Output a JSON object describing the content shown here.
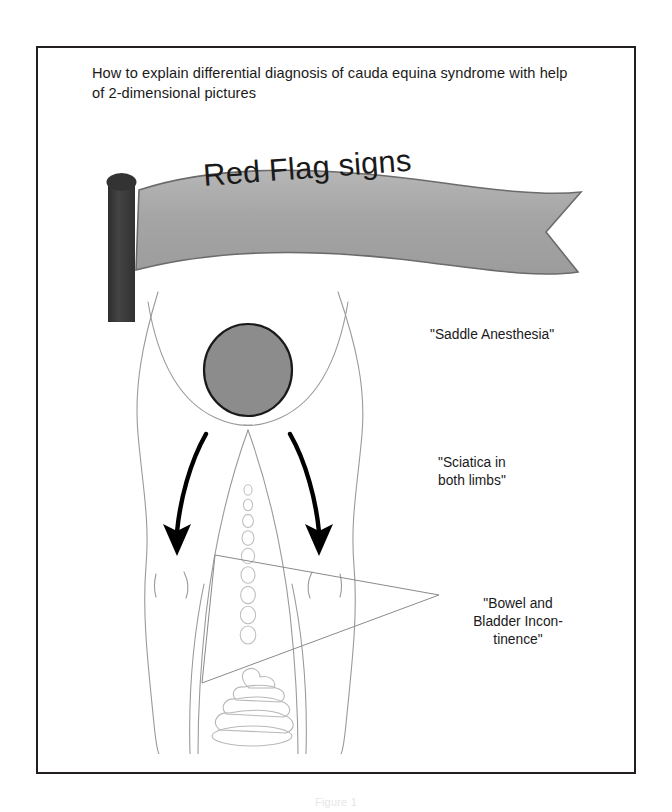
{
  "figure": {
    "title": "How to explain differential diagnosis of cauda equina syndrome with help of 2-dimensional pictures",
    "bottom_caption": "Figure 1"
  },
  "banner": {
    "label": "Red Flag signs",
    "flag_fill": "#a9a9a9",
    "flag_stroke": "#595959",
    "pole_fill": "#3b3b3b"
  },
  "illustration": {
    "outline_color": "#9a9a9a",
    "saddle_circle_fill": "#8c8c8c",
    "saddle_circle_stroke": "#1a1a1a",
    "arrow_color": "#000000",
    "pointer_color": "#8a8a8a",
    "parts": {
      "saddle_region": "saddle-area-circle",
      "left_arrow": "sciatica-arrow-left",
      "right_arrow": "sciatica-arrow-right",
      "urine_drops": "urine-drop-chain",
      "stool": "stool-shape",
      "pointer_triangle": "incontinence-pointer-triangle"
    }
  },
  "callouts": {
    "saddle": "\"Saddle Anesthesia\"",
    "sciatica": "\"Sciatica in\nboth limbs\"",
    "bowel_bladder": "\"Bowel and\nBladder Incon-\ntinence\""
  }
}
